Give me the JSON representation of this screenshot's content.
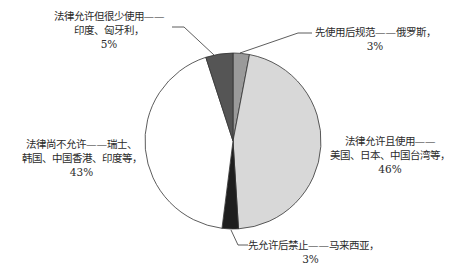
{
  "chart_data": {
    "type": "pie",
    "title": "",
    "start_angle": "12 o'clock, clockwise",
    "slices": [
      {
        "label": "先使用后规范——俄罗斯",
        "line1": "先使用后规范——俄罗斯，",
        "line2": "",
        "pct_text": "3%",
        "value": 3,
        "color": "#9a9a9a"
      },
      {
        "label": "法律允许且使用——美国、日本、中国台湾等",
        "line1": "法律允许且使用——",
        "line2": "美国、日本、中国台湾等，",
        "pct_text": "46%",
        "value": 46,
        "color": "#d8d8d8"
      },
      {
        "label": "先允许后禁止——马来西亚",
        "line1": "先允许后禁止——马来西亚，",
        "line2": "",
        "pct_text": "3%",
        "value": 3,
        "color": "#1e1e1e"
      },
      {
        "label": "法律尚不允许——瑞士、韩国、中国香港、印度等",
        "line1": "法律尚不允许——瑞士、",
        "line2": "韩国、中国香港、印度等，",
        "pct_text": "43%",
        "value": 43,
        "color": "#ffffff"
      },
      {
        "label": "法律允许但很少使用——印度、匈牙利",
        "line1": "法律允许但很少使用——",
        "line2": "印度、匈牙利，",
        "pct_text": "5%",
        "value": 5,
        "color": "#555555"
      }
    ],
    "legend": "none (leader-line labels)",
    "outline_color": "#333333"
  }
}
